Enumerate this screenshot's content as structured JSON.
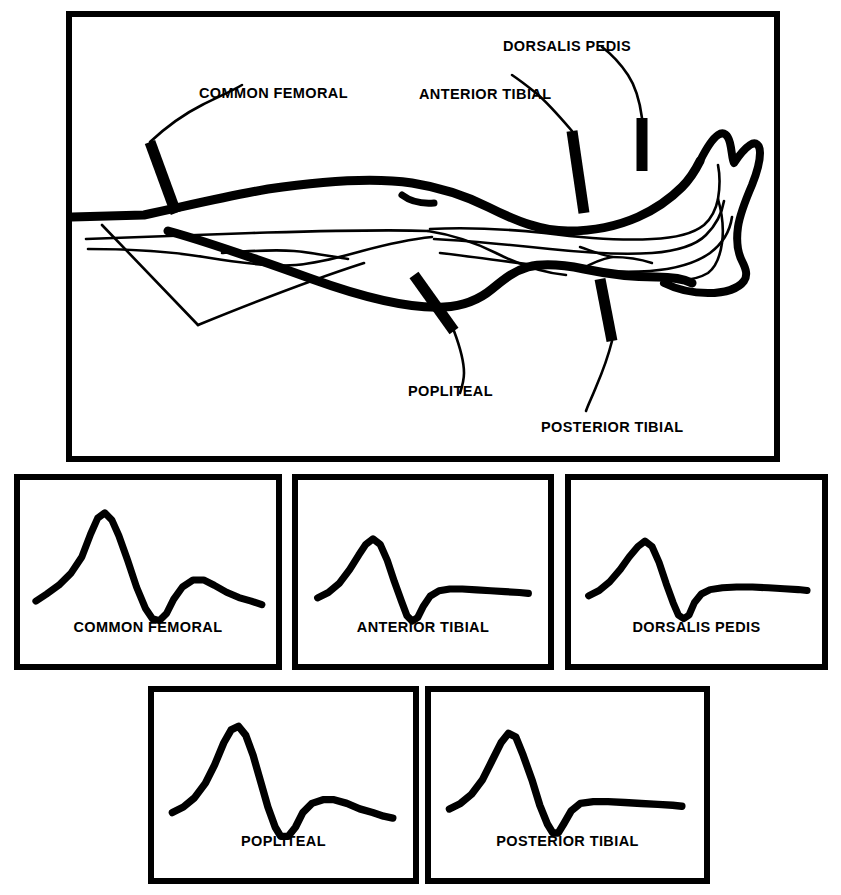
{
  "figure": {
    "type": "medical-illustration"
  },
  "anatomy": {
    "name": "leg-arterial-diagram",
    "probe_labels": [
      {
        "id": "common-femoral",
        "text": "COMMON FEMORAL",
        "x": 199,
        "y": 80,
        "probe_x": 142,
        "probe_y": 178
      },
      {
        "id": "anterior-tibial",
        "text": "ANTERIOR TIBIAL",
        "x": 419,
        "y": 81,
        "probe_x": 567,
        "probe_y": 176
      },
      {
        "id": "dorsalis-pedis",
        "text": "DORSALIS PEDIS",
        "x": 503,
        "y": 33,
        "probe_x": 637,
        "probe_y": 122
      },
      {
        "id": "popliteal",
        "text": "POPLITEAL",
        "x": 408,
        "y": 378,
        "probe_x": 424,
        "probe_y": 272
      },
      {
        "id": "posterior-tibial",
        "text": "POSTERIOR TIBIAL",
        "x": 541,
        "y": 414,
        "probe_x": 601,
        "probe_y": 282
      }
    ]
  },
  "chart_data": {
    "type": "line",
    "xlabel": "",
    "ylabel": "",
    "grid": false,
    "legend": "none",
    "series": [
      {
        "name": "COMMON FEMORAL",
        "description": "Triphasic waveform: tall sharp systolic peak, deep early-diastolic reverse flow, prominent late-diastolic forward bump",
        "peak_height": 1.0,
        "reverse_depth": -0.42,
        "second_peak": 0.3,
        "points": "18,108 30,100 44,90 58,76 70,58 80,32 88,14 96,8 104,16 112,34 122,62 132,92 142,116 150,128 158,130 166,122 174,106 184,92 196,84 208,84 220,90 234,98 248,104 262,108 274,112"
      },
      {
        "name": "ANTERIOR TIBIAL",
        "description": "Biphasic / blunted triphasic: moderate systolic peak, sharp narrow reverse trough, flat low-level diastolic plateau",
        "peak_height": 0.72,
        "reverse_depth": -0.4,
        "second_peak": 0.06,
        "points": "22,104 34,98 46,88 58,72 68,56 76,44 84,38 92,44 100,62 108,86 116,108 122,124 128,130 134,126 140,114 148,102 158,96 170,94 184,94 200,95 216,96 232,97 248,98 258,99"
      },
      {
        "name": "DORSALIS PEDIS",
        "description": "Biphasic waveform: rounded systolic peak, narrow reverse trough, flat diastolic plateau",
        "peak_height": 0.7,
        "reverse_depth": -0.38,
        "second_peak": 0.05,
        "points": "20,102 32,96 44,86 56,72 66,58 76,46 84,40 92,46 100,64 108,88 116,110 122,124 128,128 134,124 140,110 148,100 158,95 172,93 188,92 206,92 224,93 242,94 258,95 268,96"
      },
      {
        "name": "POPLITEAL",
        "description": "Triphasic waveform: sharp systolic peak, deep reverse trough, rounded late-diastolic forward bump with decay",
        "peak_height": 0.92,
        "reverse_depth": -0.46,
        "second_peak": 0.26,
        "points": "20,106 32,100 44,90 56,74 66,54 76,30 84,16 92,12 100,22 108,44 116,72 124,100 132,122 138,132 146,132 154,122 162,106 172,96 184,92 196,92 210,96 224,102 238,106 250,110 260,112"
      },
      {
        "name": "POSTERIOR TIBIAL",
        "description": "Biphasic waveform: sharp systolic peak, deep narrow reverse trough, flat diastolic plateau",
        "peak_height": 0.8,
        "reverse_depth": -0.44,
        "second_peak": 0.06,
        "points": "20,102 32,96 44,86 56,70 66,50 76,30 84,20 92,24 100,44 110,72 118,98 126,118 132,128 138,128 144,118 152,104 162,96 176,94 192,94 210,95 228,96 246,97 262,98 272,99"
      }
    ]
  },
  "panels": {
    "top_row": [
      {
        "id": "common-femoral-panel",
        "label": "COMMON FEMORAL",
        "series": 0,
        "x": 14,
        "y": 474,
        "w": 268,
        "h": 196,
        "label_y": 140
      },
      {
        "id": "anterior-tibial-panel",
        "label": "ANTERIOR TIBIAL",
        "series": 1,
        "x": 292,
        "y": 474,
        "w": 262,
        "h": 196,
        "label_y": 140
      },
      {
        "id": "dorsalis-pedis-panel",
        "label": "DORSALIS PEDIS",
        "series": 2,
        "x": 565,
        "y": 474,
        "w": 263,
        "h": 196,
        "label_y": 140
      }
    ],
    "bottom_row": [
      {
        "id": "popliteal-panel",
        "label": "POPLITEAL",
        "series": 3,
        "x": 148,
        "y": 686,
        "w": 271,
        "h": 198,
        "label_y": 142
      },
      {
        "id": "posterior-tibial-panel",
        "label": "POSTERIOR TIBIAL",
        "series": 4,
        "x": 425,
        "y": 686,
        "w": 285,
        "h": 198,
        "label_y": 142
      }
    ]
  },
  "colors": {
    "ink": "#000000",
    "paper": "#ffffff"
  }
}
